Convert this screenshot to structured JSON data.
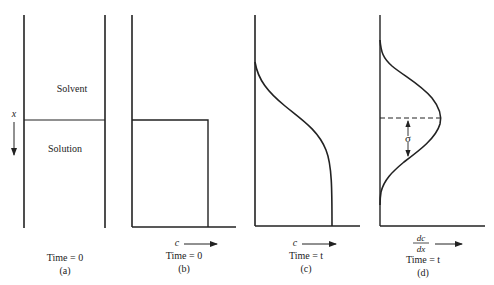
{
  "figure": {
    "panels": [
      {
        "id": "a",
        "region_top_label": "Solvent",
        "region_bottom_label": "Solution",
        "axis_label": "x",
        "time_label": "Time = 0",
        "panel_label": "(a)"
      },
      {
        "id": "b",
        "axis_label": "c",
        "time_label": "Time = 0",
        "panel_label": "(b)"
      },
      {
        "id": "c",
        "axis_label": "c",
        "time_label": "Time = t",
        "panel_label": "(c)"
      },
      {
        "id": "d",
        "axis_label_num": "dc",
        "axis_label_den": "dx",
        "sigma_label": "σ",
        "time_label": "Time = t",
        "panel_label": "(d)"
      }
    ],
    "colors": {
      "line": "#222222",
      "background": "#ffffff"
    }
  }
}
